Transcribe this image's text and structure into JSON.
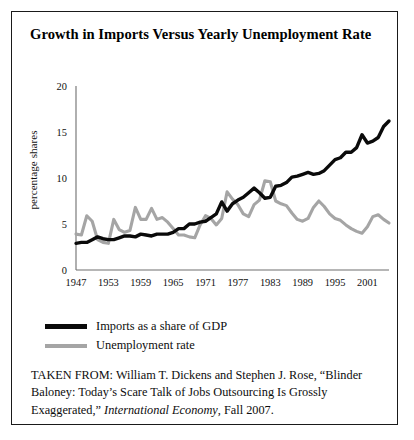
{
  "figure": {
    "title": "Growth in Imports Versus Yearly Unemployment Rate",
    "source_prefix": "TAKEN FROM: ",
    "source_text_1": "William T. Dickens and Stephen J. Rose, “Blinder Baloney: Today’s Scare Talk of Jobs Outsourcing Is Grossly Exaggerated,” ",
    "source_italic": "International Economy",
    "source_text_2": ", Fall 2007.",
    "source_full": "TAKEN FROM: William T. Dickens and Stephen J. Rose, “Blinder Baloney: Today’s Scare Talk of Jobs Outsourcing Is Grossly Exaggerated,” International Economy, Fall 2007."
  },
  "colors": {
    "imports_line": "#0a0a0a",
    "unemployment_line": "#a5a5a5",
    "axis": "#6e6e6e",
    "frame": "#1a1a1a",
    "background": "#ffffff",
    "text": "#0d0d0d"
  },
  "legend": {
    "position": "below-plot",
    "items": [
      {
        "label": "Imports as a share of GDP",
        "color": "#0a0a0a",
        "thickness": "thick"
      },
      {
        "label": "Unemployment rate",
        "color": "#a5a5a5",
        "thickness": "medium"
      }
    ]
  },
  "chart_data": {
    "type": "line",
    "title": "Growth in Imports Versus Yearly Unemployment Rate",
    "xlabel": "",
    "ylabel": "percentage shares",
    "xlim": [
      1947,
      2005
    ],
    "ylim": [
      0,
      20
    ],
    "yticks": [
      0,
      5,
      10,
      15,
      20
    ],
    "ytick_labels": [
      "0",
      "5",
      "10",
      "15",
      "20"
    ],
    "xticks": [
      1947,
      1953,
      1959,
      1965,
      1971,
      1977,
      1983,
      1989,
      1995,
      2001
    ],
    "xtick_labels": [
      "1947",
      "1953",
      "1959",
      "1965",
      "1971",
      "1977",
      "1983",
      "1989",
      "1995",
      "2001"
    ],
    "grid": false,
    "legend_position": "bottom-left",
    "x": [
      1947,
      1948,
      1949,
      1950,
      1951,
      1952,
      1953,
      1954,
      1955,
      1956,
      1957,
      1958,
      1959,
      1960,
      1961,
      1962,
      1963,
      1964,
      1965,
      1966,
      1967,
      1968,
      1969,
      1970,
      1971,
      1972,
      1973,
      1974,
      1975,
      1976,
      1977,
      1978,
      1979,
      1980,
      1981,
      1982,
      1983,
      1984,
      1985,
      1986,
      1987,
      1988,
      1989,
      1990,
      1991,
      1992,
      1993,
      1994,
      1995,
      1996,
      1997,
      1998,
      1999,
      2000,
      2001,
      2002,
      2003,
      2004,
      2005
    ],
    "series": [
      {
        "name": "Imports as a share of GDP",
        "color": "#0a0a0a",
        "values": [
          2.9,
          3.0,
          3.0,
          3.3,
          3.6,
          3.4,
          3.3,
          3.3,
          3.5,
          3.7,
          3.7,
          3.6,
          3.9,
          3.8,
          3.7,
          3.9,
          3.9,
          3.9,
          4.1,
          4.5,
          4.5,
          5.0,
          5.0,
          5.2,
          5.3,
          5.7,
          6.1,
          7.4,
          6.4,
          7.2,
          7.6,
          7.9,
          8.4,
          8.9,
          8.4,
          7.8,
          7.9,
          9.1,
          9.2,
          9.5,
          10.1,
          10.2,
          10.4,
          10.6,
          10.4,
          10.5,
          10.8,
          11.4,
          12.0,
          12.2,
          12.8,
          12.8,
          13.3,
          14.7,
          13.8,
          14.0,
          14.4,
          15.6,
          16.2
        ]
      },
      {
        "name": "Unemployment rate",
        "color": "#a5a5a5",
        "values": [
          3.9,
          3.8,
          5.9,
          5.3,
          3.3,
          3.0,
          2.9,
          5.5,
          4.4,
          4.1,
          4.3,
          6.8,
          5.5,
          5.5,
          6.7,
          5.5,
          5.7,
          5.2,
          4.5,
          3.8,
          3.8,
          3.6,
          3.5,
          4.9,
          5.9,
          5.6,
          4.9,
          5.6,
          8.5,
          7.7,
          7.1,
          6.1,
          5.8,
          7.1,
          7.6,
          9.7,
          9.6,
          7.5,
          7.2,
          7.0,
          6.2,
          5.5,
          5.3,
          5.6,
          6.8,
          7.5,
          6.9,
          6.1,
          5.6,
          5.4,
          4.9,
          4.5,
          4.2,
          4.0,
          4.7,
          5.8,
          6.0,
          5.5,
          5.1
        ]
      }
    ]
  }
}
